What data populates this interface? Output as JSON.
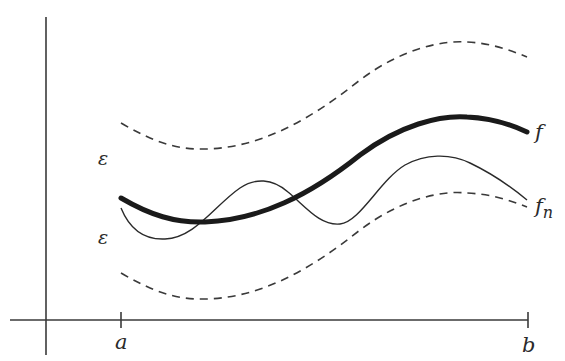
{
  "diagram": {
    "labels": {
      "f": "f",
      "fn_base": "f",
      "fn_sub": "n",
      "epsilon_upper": "ε",
      "epsilon_lower": "ε",
      "a": "a",
      "b": "b"
    },
    "curves": [
      {
        "name": "f",
        "style": "thick solid"
      },
      {
        "name": "f_n",
        "style": "thin solid"
      },
      {
        "name": "f + ε",
        "style": "dashed"
      },
      {
        "name": "f - ε",
        "style": "dashed"
      }
    ],
    "colors": {
      "ink": "#1a1a1a",
      "background": "#ffffff"
    }
  }
}
